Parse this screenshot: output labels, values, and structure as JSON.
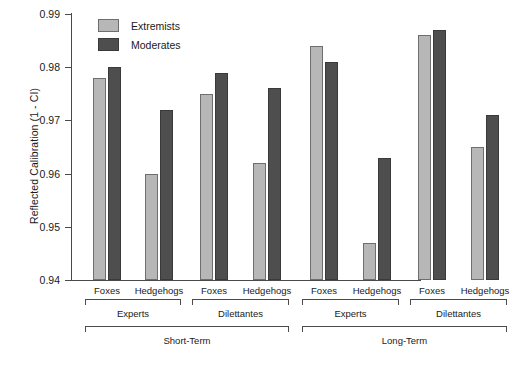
{
  "chart_data": {
    "type": "bar",
    "title": "",
    "subtitle": "",
    "xlabel": "",
    "ylabel": "Reflected Calibration (1 - CI)",
    "ylim": [
      0.94,
      0.99
    ],
    "ytick_labels": [
      "0.99",
      "0.98",
      "0.97",
      "0.96",
      "0.95",
      "0.94"
    ],
    "ytick_values": [
      0.99,
      0.98,
      0.97,
      0.96,
      0.95,
      0.94
    ],
    "grid": false,
    "legend_position": "top-left-inside",
    "legend": [
      "Extremists",
      "Moderates"
    ],
    "colors": {
      "extremists": "#b7b7b7",
      "extremists_edge": "#6e6e6e",
      "moderates": "#4e4e4e",
      "moderates_edge": "#3a3a3a",
      "axis": "#4a4a4a",
      "text": "#1a1a1a",
      "background": "#ffffff"
    },
    "categories": [
      "Foxes",
      "Hedgehogs",
      "Foxes",
      "Hedgehogs",
      "Foxes",
      "Hedgehogs",
      "Foxes",
      "Hedgehogs"
    ],
    "group_level_2": [
      "Experts",
      "Dilettantes",
      "Experts",
      "Dilettantes"
    ],
    "group_level_3": [
      "Short-Term",
      "Long-Term"
    ],
    "series": [
      {
        "name": "Extremists",
        "values": [
          0.978,
          0.96,
          0.975,
          0.962,
          0.984,
          0.947,
          0.986,
          0.965
        ]
      },
      {
        "name": "Moderates",
        "values": [
          0.98,
          0.972,
          0.979,
          0.976,
          0.981,
          0.963,
          0.987,
          0.971
        ]
      }
    ]
  },
  "axis": {
    "y_title": "Reflected Calibration (1 - CI)",
    "ticks": [
      "0.99",
      "0.98",
      "0.97",
      "0.96",
      "0.95",
      "0.94"
    ]
  },
  "legend": {
    "items": [
      {
        "label": "Extremists",
        "swatch": "light-gray-swatch"
      },
      {
        "label": "Moderates",
        "swatch": "dark-gray-swatch"
      }
    ]
  },
  "xaxis": {
    "level1": [
      "Foxes",
      "Hedgehogs",
      "Foxes",
      "Hedgehogs",
      "Foxes",
      "Hedgehogs",
      "Foxes",
      "Hedgehogs"
    ],
    "level2": [
      "Experts",
      "Dilettantes",
      "Experts",
      "Dilettantes"
    ],
    "level3": [
      "Short-Term",
      "Long-Term"
    ]
  }
}
